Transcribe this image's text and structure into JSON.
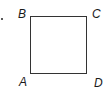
{
  "figure": {
    "shape": "square",
    "vertices": {
      "top_left": "B",
      "top_right": "C",
      "bottom_left": "A",
      "bottom_right": "D"
    },
    "marker": "."
  }
}
